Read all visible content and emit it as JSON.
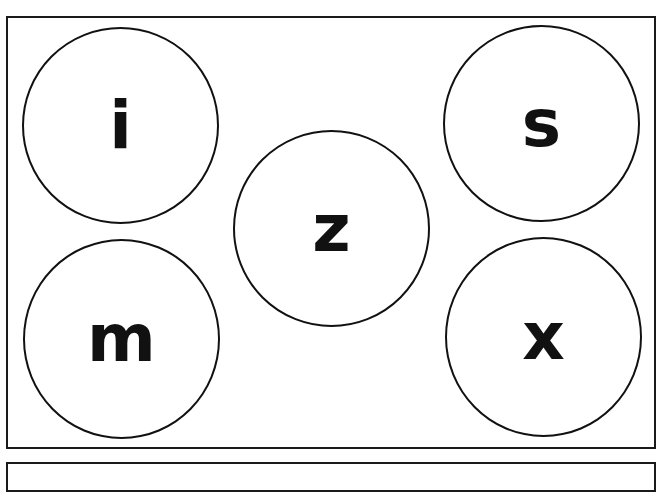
{
  "worksheet": {
    "circles": [
      {
        "letter": "i",
        "cx": 120,
        "cy": 125,
        "r": 98
      },
      {
        "letter": "s",
        "cx": 541,
        "cy": 123,
        "r": 98
      },
      {
        "letter": "z",
        "cx": 331,
        "cy": 228,
        "r": 98
      },
      {
        "letter": "m",
        "cx": 121,
        "cy": 338,
        "r": 98
      },
      {
        "letter": "x",
        "cx": 543,
        "cy": 337,
        "r": 98
      }
    ]
  },
  "colors": {
    "stroke": "#111111",
    "background": "#ffffff"
  }
}
